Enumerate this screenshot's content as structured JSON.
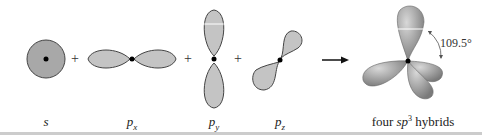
{
  "diagram": {
    "labels": {
      "s": "s",
      "px_base": "p",
      "px_sub": "x",
      "py_base": "p",
      "py_sub": "y",
      "pz_base": "p",
      "pz_sub": "z"
    },
    "hybrid_label": {
      "prefix": "four ",
      "sp": "sp",
      "sup": "3",
      "suffix": " hybrids"
    },
    "plus_sign": "+",
    "angle": "109.5°",
    "colors": {
      "s_fill": "#a8a8a8",
      "p_fill": "#c4c4c4",
      "hybrid_fill": "#9c9c9c",
      "outline": "#444444",
      "nucleus": "#000000"
    }
  }
}
